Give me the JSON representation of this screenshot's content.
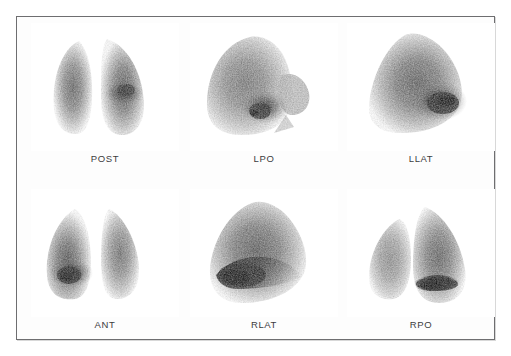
{
  "document": {
    "title": "Lung Perfusion Scintigraphy Montage",
    "modality": "nuclear-medicine-planar-scintigram",
    "layout": {
      "rows": 2,
      "columns": 3,
      "total_views": 6
    },
    "frame": {
      "border_color": "#6e6e70",
      "background_color": "#fdfdfd",
      "page_background": "#ffffff"
    },
    "label_style": {
      "color": "#3c3c3e",
      "font_size_px": 9.5
    }
  },
  "views": [
    {
      "id": "post",
      "label": "POST",
      "name": "posterior-view",
      "row": 0,
      "column": 0,
      "shape": "two-lungs",
      "description": "Posterior projection showing both lung fields separated by mediastinal photopenia",
      "hotspots": [
        {
          "cx": 0.63,
          "cy": 0.56,
          "intensity": 0.95
        }
      ]
    },
    {
      "id": "lpo",
      "label": "LPO",
      "name": "left-posterior-oblique-view",
      "row": 0,
      "column": 1,
      "shape": "oblique",
      "description": "Left posterior oblique projection with dense basal activity",
      "hotspots": [
        {
          "cx": 0.52,
          "cy": 0.68,
          "intensity": 1.0
        }
      ]
    },
    {
      "id": "llat",
      "label": "LLAT",
      "name": "left-lateral-view",
      "row": 0,
      "column": 2,
      "shape": "lateral",
      "description": "Left lateral projection, intense uptake in posterobasal region",
      "hotspots": [
        {
          "cx": 0.66,
          "cy": 0.63,
          "intensity": 1.0
        }
      ]
    },
    {
      "id": "ant",
      "label": "ANT",
      "name": "anterior-view",
      "row": 1,
      "column": 0,
      "shape": "two-lungs",
      "description": "Anterior projection, focal intense activity at left lower zone",
      "hotspots": [
        {
          "cx": 0.27,
          "cy": 0.72,
          "intensity": 1.0
        }
      ]
    },
    {
      "id": "rlat",
      "label": "RLAT",
      "name": "right-lateral-view",
      "row": 1,
      "column": 1,
      "shape": "lateral",
      "description": "Right lateral projection with broad dense band across mid and lower lung",
      "hotspots": [
        {
          "cx": 0.4,
          "cy": 0.66,
          "intensity": 1.0
        }
      ]
    },
    {
      "id": "rpo",
      "label": "RPO",
      "name": "right-posterior-oblique-view",
      "row": 1,
      "column": 2,
      "shape": "oblique-flipped",
      "description": "Right posterior oblique projection, dense linear basal uptake",
      "hotspots": [
        {
          "cx": 0.58,
          "cy": 0.76,
          "intensity": 1.0
        }
      ]
    }
  ]
}
